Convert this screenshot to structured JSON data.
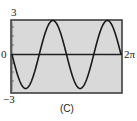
{
  "chart_data": {
    "type": "line",
    "title": "",
    "caption": "(C)",
    "xlabel": "",
    "ylabel": "",
    "xlim": [
      0,
      6.2832
    ],
    "ylim": [
      -3,
      3
    ],
    "x_tick_labels": [
      "0",
      "2π"
    ],
    "y_tick_labels": [
      "3",
      "0",
      "−3"
    ],
    "grid": false,
    "series": [
      {
        "name": "curve",
        "function": "y = -3 sin(2x)",
        "x": [
          0,
          0.785,
          1.571,
          2.356,
          3.142,
          3.927,
          4.712,
          5.498,
          6.283
        ],
        "y": [
          0,
          -3,
          0,
          3,
          0,
          -3,
          0,
          3,
          0
        ]
      }
    ],
    "colors": {
      "background": "#d9d9d9",
      "curve": "#1a1a1a",
      "frame": "#333333"
    }
  },
  "labels": {
    "y_max": "3",
    "y_zero": "0",
    "y_min": "−3",
    "x_max": "2π",
    "caption": "(C)"
  }
}
